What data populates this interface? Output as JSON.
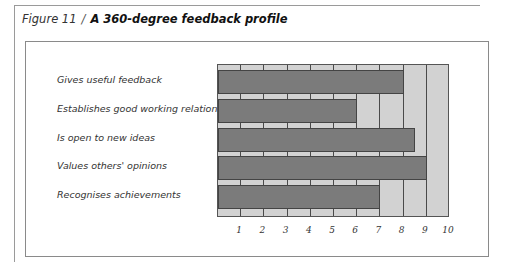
{
  "figure": {
    "number": "Figure 11",
    "separator": "/",
    "title": "A 360-degree feedback profile"
  },
  "chart_data": {
    "type": "bar",
    "orientation": "horizontal",
    "title": "A 360-degree feedback profile",
    "categories": [
      "Gives useful feedback",
      "Establishes good working relationships",
      "Is open to new ideas",
      "Values others' opinions",
      "Recognises achievements"
    ],
    "values": [
      8,
      6,
      8.5,
      9,
      7
    ],
    "xlabel": "",
    "ylabel": "",
    "xlim": [
      0,
      10
    ],
    "x_ticks": [
      "1",
      "2",
      "3",
      "4",
      "5",
      "6",
      "7",
      "8",
      "9",
      "10"
    ],
    "grid": true,
    "legend": null,
    "colors": {
      "bar": "#7b7b7b",
      "background": "#d2d2d2",
      "grid": "#4a4a4a"
    }
  }
}
